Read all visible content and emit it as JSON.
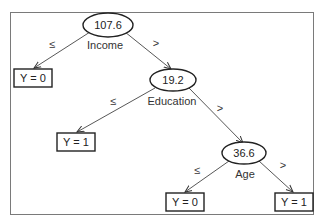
{
  "diagram": {
    "type": "decision-tree",
    "nodes": [
      {
        "id": "n1",
        "kind": "split",
        "threshold": "107.6",
        "feature": "Income"
      },
      {
        "id": "n2",
        "kind": "leaf",
        "label": "Y = 0"
      },
      {
        "id": "n3",
        "kind": "split",
        "threshold": "19.2",
        "feature": "Education"
      },
      {
        "id": "n4",
        "kind": "leaf",
        "label": "Y = 1"
      },
      {
        "id": "n5",
        "kind": "split",
        "threshold": "36.6",
        "feature": "Age"
      },
      {
        "id": "n6",
        "kind": "leaf",
        "label": "Y = 0"
      },
      {
        "id": "n7",
        "kind": "leaf",
        "label": "Y = 1"
      }
    ],
    "edges": [
      {
        "from": "n1",
        "to": "n2",
        "label": "≤"
      },
      {
        "from": "n1",
        "to": "n3",
        "label": ">"
      },
      {
        "from": "n3",
        "to": "n4",
        "label": "≤"
      },
      {
        "from": "n3",
        "to": "n5",
        "label": ">"
      },
      {
        "from": "n5",
        "to": "n6",
        "label": "≤"
      },
      {
        "from": "n5",
        "to": "n7",
        "label": ">"
      }
    ]
  }
}
